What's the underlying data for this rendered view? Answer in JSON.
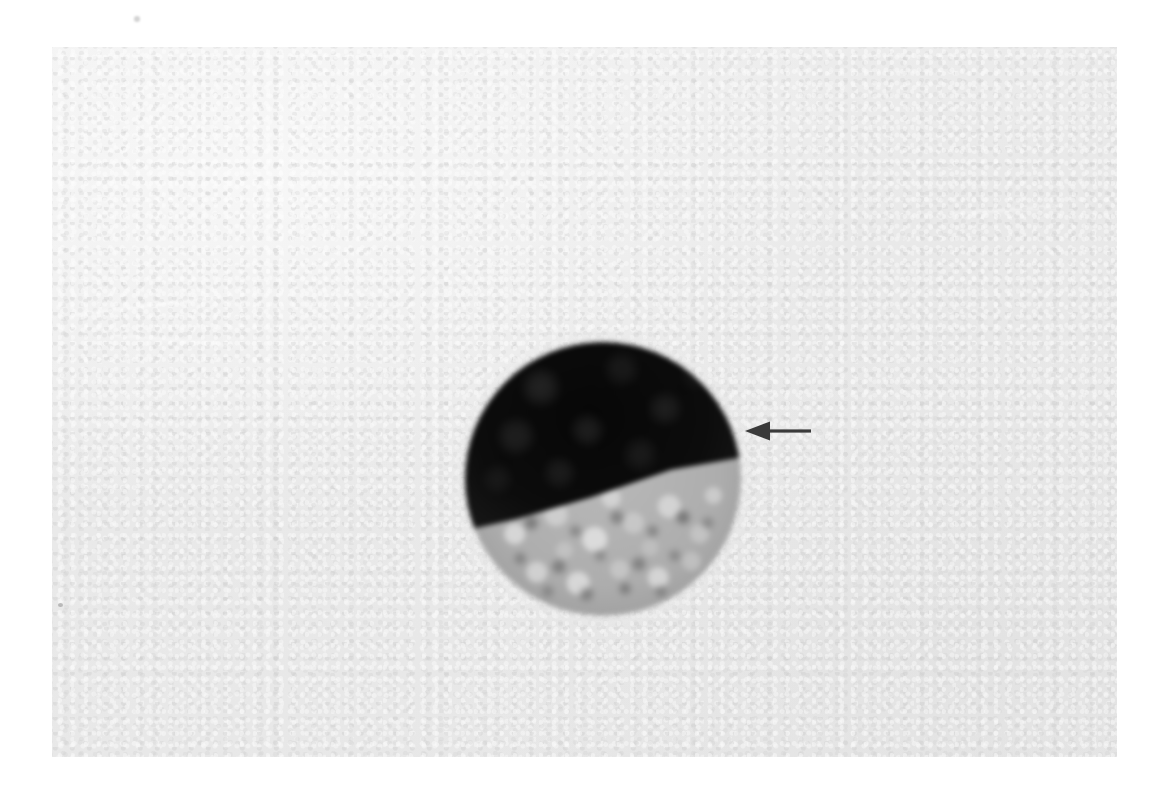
{
  "figure": {
    "domain": "natural-image",
    "kind": "micrograph",
    "caption": "",
    "background_color": "#ffffff",
    "plate": {
      "name": "photographic-plate",
      "background_color": "#e9e9e9",
      "left": 52,
      "top": 47,
      "width": 1065,
      "height": 710
    }
  },
  "specimen": {
    "label": "cell",
    "description": "Single round cell with a large darkly stained nucleus occupying the upper portion and a pale granular vacuolated cytoplasm in the lower portion",
    "center_x": 602,
    "center_y": 478,
    "diameter_px": 275,
    "nucleus": {
      "label": "nucleus",
      "color": "#0c0c0c",
      "position": "upper",
      "area_fraction": 0.55,
      "border_orientation": "oblique, higher on the right"
    },
    "cytoplasm": {
      "label": "cytoplasm",
      "color": "#b4b4b4",
      "position": "lower",
      "texture": "coarsely granular / vacuolated",
      "granule_light_color": "#d8d8d8",
      "granule_dark_color": "#585858"
    }
  },
  "annotations": [
    {
      "name": "pointer-arrow",
      "shape": "left-pointing-arrow",
      "color": "#3a3a3a",
      "tip_x": 745,
      "tip_y": 431,
      "tail_x": 806,
      "length_px": 61,
      "points_at": "nucleus-cytoplasm-border",
      "text": ""
    }
  ],
  "artifacts": [
    {
      "name": "margin-speck",
      "x": 137,
      "y": 19,
      "color": "#a5a5a5"
    },
    {
      "name": "plate-edge-speck",
      "x": 58,
      "y": 603,
      "color": "#787878"
    }
  ]
}
